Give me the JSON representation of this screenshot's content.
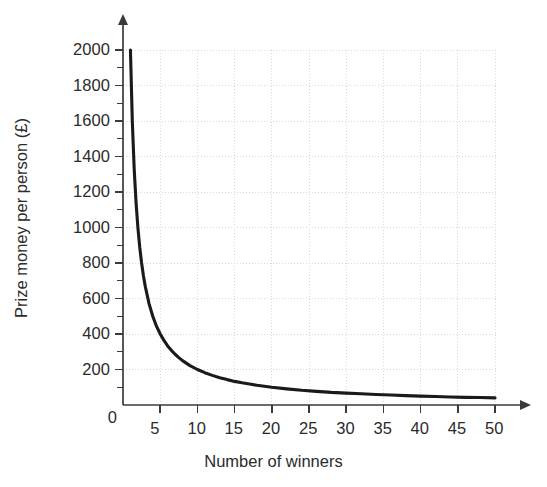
{
  "chart_data": {
    "type": "line",
    "title": "",
    "subtitle": "",
    "xlabel": "Number of winners",
    "ylabel": "Prize money per person (£)",
    "xlim": [
      0,
      52
    ],
    "ylim": [
      0,
      2050
    ],
    "grid": true,
    "legend": null,
    "curve_equation": "y = 2000 / x",
    "line_color": "#1a1a1a",
    "grid_color": "#d8d8d8",
    "axis_color": "#3a3a3a",
    "x_ticks": [
      5,
      10,
      15,
      20,
      25,
      30,
      35,
      40,
      45,
      50
    ],
    "x_tick_labels": [
      "5",
      "10",
      "15",
      "20",
      "25",
      "30",
      "35",
      "40",
      "45",
      "50"
    ],
    "y_ticks": [
      0,
      200,
      400,
      600,
      800,
      1000,
      1200,
      1400,
      1600,
      1800,
      2000
    ],
    "y_tick_labels": [
      "0",
      "200",
      "400",
      "600",
      "800",
      "1000",
      "1200",
      "1400",
      "1600",
      "1800",
      "2000"
    ],
    "y_minor_ticks": [
      100,
      300,
      500,
      700,
      900,
      1100,
      1300,
      1500,
      1700,
      1900
    ],
    "x_gridlines": [
      5,
      10,
      15,
      20,
      25,
      30,
      35,
      40,
      45,
      50
    ],
    "y_gridlines": [
      200,
      400,
      600,
      800,
      1000,
      1200,
      1400,
      1600,
      1800,
      2000
    ],
    "x": [
      1,
      1.25,
      1.5,
      1.75,
      2,
      2.25,
      2.5,
      2.75,
      3,
      3.5,
      4,
      4.5,
      5,
      5.5,
      6,
      6.5,
      7,
      7.5,
      8,
      9,
      10,
      11,
      12,
      13,
      14,
      15,
      16,
      17,
      18,
      20,
      22,
      24,
      26,
      28,
      30,
      32,
      34,
      36,
      38,
      40,
      42,
      44,
      46,
      48,
      50
    ],
    "y": [
      2000,
      1600,
      1333,
      1143,
      1000,
      889,
      800,
      727,
      667,
      571,
      500,
      444,
      400,
      364,
      333,
      308,
      286,
      267,
      250,
      222,
      200,
      182,
      167,
      154,
      143,
      133,
      125,
      118,
      111,
      100,
      91,
      83,
      77,
      71,
      67,
      63,
      59,
      56,
      53,
      50,
      48,
      45,
      43,
      42,
      40
    ],
    "series": [
      {
        "name": "Prize money per person",
        "values": [
          2000,
          1600,
          1333,
          1143,
          1000,
          889,
          800,
          727,
          667,
          571,
          500,
          444,
          400,
          364,
          333,
          308,
          286,
          267,
          250,
          222,
          200,
          182,
          167,
          154,
          143,
          133,
          125,
          118,
          111,
          100,
          91,
          83,
          77,
          71,
          67,
          63,
          59,
          56,
          53,
          50,
          48,
          45,
          43,
          42,
          40
        ]
      }
    ],
    "annotations": []
  }
}
